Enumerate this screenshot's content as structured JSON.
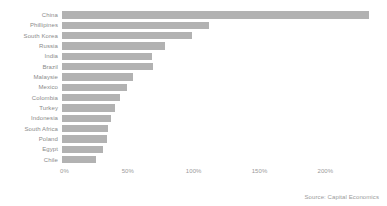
{
  "source_note": "Source: Capital Economics",
  "chart_data": {
    "type": "bar",
    "orientation": "horizontal",
    "title": "",
    "subtitle": "",
    "xlabel": "",
    "ylabel": "",
    "grid": false,
    "legend": null,
    "bar_color": "#b2b2b2",
    "text_color": "#8a8a8a",
    "background": "#ffffff",
    "xlim": [
      0,
      240
    ],
    "xticks": [
      0,
      50,
      100,
      150,
      200
    ],
    "xtick_labels": [
      "0%",
      "50%",
      "100%",
      "150%",
      "200%"
    ],
    "categories": [
      "China",
      "Phillipines",
      "South Korea",
      "Russia",
      "India",
      "Brazil",
      "Malaysie",
      "Mexico",
      "Colombia",
      "Turkey",
      "Indonesia",
      "South Africa",
      "Poland",
      "Egypt",
      "Chile"
    ],
    "values": [
      233,
      112,
      99,
      78,
      68,
      69,
      54,
      49,
      44,
      40,
      37,
      35,
      34,
      31,
      26
    ]
  }
}
